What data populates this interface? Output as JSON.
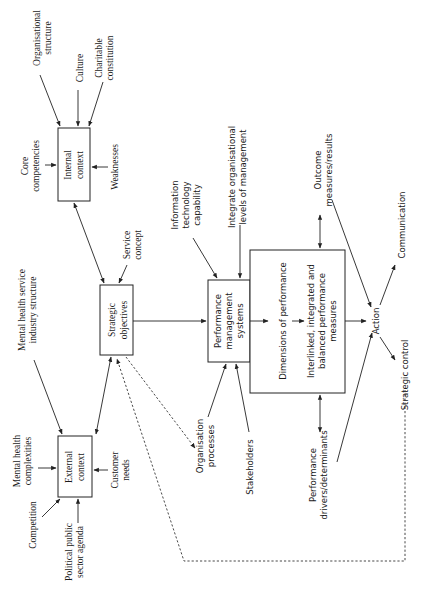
{
  "diagram": {
    "boxes": {
      "internal_context": [
        "Internal",
        "context"
      ],
      "external_context": [
        "External",
        "context"
      ],
      "strategic_objectives": [
        "Strategic",
        "objectives"
      ],
      "performance_management": [
        "Performance",
        "management",
        "systems"
      ],
      "dimensions": [
        "Dimensions of performance"
      ],
      "measures": [
        "Interlinked, integrated and",
        "balanced performance",
        "measures"
      ]
    },
    "labels": {
      "organisational_structure": [
        "Organisational",
        "structure"
      ],
      "culture": [
        "Culture"
      ],
      "charitable_constitution": [
        "Charitable",
        "constitution"
      ],
      "core_competencies": [
        "Core",
        "competencies"
      ],
      "weaknesses": [
        "Weaknesses"
      ],
      "mental_health_industry": [
        "Mental health service",
        "industry structure"
      ],
      "service_concept": [
        "Service",
        "concept"
      ],
      "mental_health_complexities": [
        "Mental health",
        "complexities"
      ],
      "competition": [
        "Competition"
      ],
      "political_agenda": [
        "Political public",
        "sector agenda"
      ],
      "customer_needs": [
        "Customer",
        "needs"
      ],
      "organisation_processes": [
        "Organisation",
        "processes"
      ],
      "stakeholders": [
        "Stakeholders"
      ],
      "it_capability": [
        "Information",
        "technology",
        "capability"
      ],
      "integrate_levels": [
        "Integrate organisational",
        "levels of management"
      ],
      "outcome_measures": [
        "Outcome",
        "measures/results"
      ],
      "performance_drivers": [
        "Performance",
        "drivers/determinants"
      ],
      "action": [
        "Action"
      ],
      "communication": [
        "Communication"
      ],
      "strategic_control": [
        "Strategic control"
      ]
    }
  }
}
